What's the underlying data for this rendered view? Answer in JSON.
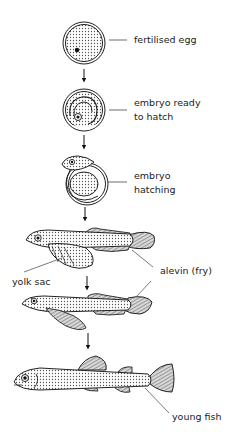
{
  "diagram": {
    "type": "life-cycle",
    "stages": [
      {
        "id": "fertilised-egg",
        "label_line1": "fertilised egg",
        "label_line2": ""
      },
      {
        "id": "embryo-ready",
        "label_line1": "embryo ready",
        "label_line2": "to hatch"
      },
      {
        "id": "embryo-hatching",
        "label_line1": "embryo",
        "label_line2": "hatching"
      },
      {
        "id": "alevin",
        "label_line1": "alevin (fry)",
        "label_line2": ""
      },
      {
        "id": "young-fish",
        "label_line1": "young fish",
        "label_line2": ""
      }
    ],
    "extra_labels": {
      "yolk_sac": "yolk sac"
    },
    "colors": {
      "stroke": "#222222",
      "fill_stipple": "#9a9a9a",
      "background": "#ffffff"
    }
  }
}
